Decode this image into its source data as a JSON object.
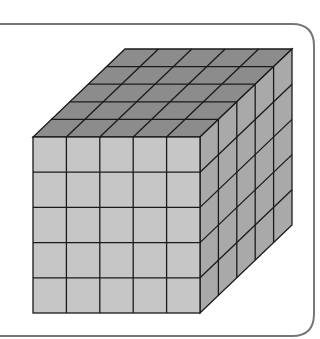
{
  "figure": {
    "grid": {
      "cols": 5,
      "rows": 5,
      "depth": 5
    },
    "colors": {
      "background": "#ffffff",
      "frame": "#777777",
      "front_face": "#c6c6c6",
      "top_face": "#8c8c8c",
      "right_face": "#a9a9a9",
      "grid_line": "#1a1a1a"
    },
    "geometry": {
      "front": {
        "x": 33,
        "y": 137,
        "w": 167,
        "h": 176
      },
      "offset": {
        "dx": 92,
        "dy": -88
      }
    }
  }
}
